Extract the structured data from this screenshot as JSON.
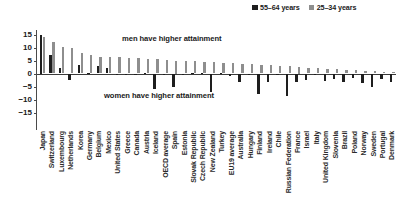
{
  "legend": {
    "entries": [
      {
        "label": "55–64 years",
        "color": "#1e1e1e",
        "swatch_name": "legend-swatch-55-64"
      },
      {
        "label": "25–34 years",
        "color": "#8e8e8e",
        "swatch_name": "legend-swatch-25-34"
      }
    ]
  },
  "annotations": {
    "men": "men have higher attainment",
    "women": "women have higher attainment"
  },
  "axis": {
    "yticks": [
      "15",
      "10",
      "5",
      "0",
      "−5",
      "−10",
      "−15"
    ]
  },
  "chart_data": {
    "type": "bar",
    "title": "",
    "subtitle": "",
    "xlabel": "",
    "ylabel": "",
    "ylim": [
      -15,
      15
    ],
    "yticks": [
      15,
      10,
      5,
      0,
      -5,
      -10,
      -15
    ],
    "grid": false,
    "legend_position": "top-right",
    "annotations": [
      {
        "text": "men have higher attainment",
        "region": "above-zero"
      },
      {
        "text": "women have higher attainment",
        "region": "below-zero"
      }
    ],
    "categories": [
      "Japan",
      "Switzerland",
      "Luxembourg",
      "Netherlands",
      "Korea",
      "Germany",
      "Belgium",
      "Mexico",
      "United States",
      "Greece",
      "Canada",
      "Austria",
      "Iceland",
      "OECD average",
      "Spain",
      "Estonia",
      "Slovak Republic",
      "Czech Republic",
      "New Zealand",
      "Turkey",
      "EU19 average",
      "Australia",
      "Hungary",
      "Finland",
      "Ireland",
      "Chile",
      "Russian Federation",
      "France",
      "Israel",
      "Italy",
      "United Kingdom",
      "Slovenia",
      "Brazil",
      "Poland",
      "Norway",
      "Sweden",
      "Portugal",
      "Denmark"
    ],
    "series": [
      {
        "name": "55–64 years",
        "color": "#1e1e1e",
        "values": [
          15.0,
          7.0,
          2.2,
          -2.5,
          3.1,
          0.2,
          3.0,
          2.2,
          -0.4,
          -0.3,
          -0.4,
          0.2,
          -5.8,
          -0.6,
          -5.0,
          -0.6,
          0.1,
          0.2,
          -7.0,
          0.1,
          -1.0,
          -3.3,
          -0.5,
          -7.8,
          -3.4,
          -0.6,
          -8.6,
          -3.3,
          -2.4,
          -0.7,
          -3.0,
          -2.2,
          -3.1,
          -1.8,
          -3.8,
          -5.2,
          -2.0,
          -3.1
        ]
      },
      {
        "name": "25–34 years",
        "color": "#8e8e8e",
        "values": [
          14.1,
          12.0,
          10.2,
          9.8,
          8.0,
          7.2,
          6.5,
          6.4,
          6.2,
          6.0,
          5.9,
          5.7,
          5.5,
          5.3,
          5.0,
          4.8,
          4.7,
          4.5,
          4.3,
          4.1,
          3.9,
          3.7,
          3.5,
          3.3,
          3.1,
          2.9,
          2.7,
          2.5,
          2.3,
          2.0,
          1.8,
          1.6,
          1.4,
          1.2,
          1.0,
          0.8,
          0.6,
          0.4
        ]
      }
    ]
  }
}
